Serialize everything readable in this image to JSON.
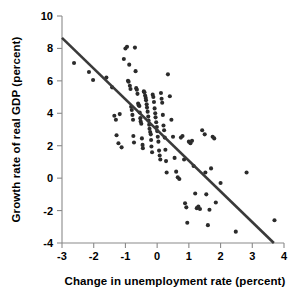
{
  "chart_data": {
    "type": "scatter",
    "title": "",
    "xlabel": "Change in unemployment rate (percent)",
    "ylabel": "Growth rate of real GDP (percent)",
    "xlim": [
      -3,
      4
    ],
    "ylim": [
      -4,
      10
    ],
    "xticks": [
      -3,
      -2,
      -1,
      0,
      1,
      2,
      3,
      4
    ],
    "yticks": [
      -4,
      -2,
      0,
      2,
      4,
      6,
      8,
      10
    ],
    "xticklabels": [
      "-3",
      "-2",
      "-1",
      "0",
      "1",
      "2",
      "3",
      "4"
    ],
    "yticklabels": [
      "-4",
      "-2",
      "0",
      "2",
      "4",
      "6",
      "8",
      "10"
    ],
    "grid": false,
    "legend": null,
    "point_color": "#2b2b2b",
    "line_color": "#3a3a3a",
    "axis_color": "#8a8a8a",
    "trend_line": {
      "label": "regression line",
      "x_start": -3.0,
      "y_start": 8.65,
      "x_end": 3.68,
      "y_end": -4.0,
      "slope": -1.894,
      "intercept": 2.97
    },
    "points": [
      [
        -2.62,
        7.1
      ],
      [
        -2.15,
        6.55
      ],
      [
        -2.02,
        6.05
      ],
      [
        -1.6,
        6.2
      ],
      [
        -1.42,
        5.6
      ],
      [
        -1.35,
        3.85
      ],
      [
        -1.3,
        3.6
      ],
      [
        -1.28,
        2.65
      ],
      [
        -1.22,
        2.15
      ],
      [
        -1.18,
        3.95
      ],
      [
        -1.12,
        1.9
      ],
      [
        -1.05,
        7.35
      ],
      [
        -1.0,
        8.0
      ],
      [
        -0.95,
        8.1
      ],
      [
        -0.92,
        6.0
      ],
      [
        -0.9,
        5.95
      ],
      [
        -0.88,
        7.0
      ],
      [
        -0.86,
        5.7
      ],
      [
        -0.84,
        5.5
      ],
      [
        -0.82,
        4.4
      ],
      [
        -0.8,
        4.2
      ],
      [
        -0.78,
        3.9
      ],
      [
        -0.76,
        3.6
      ],
      [
        -0.75,
        2.6
      ],
      [
        -0.73,
        2.2
      ],
      [
        -0.7,
        8.05
      ],
      [
        -0.68,
        6.6
      ],
      [
        -0.66,
        5.55
      ],
      [
        -0.64,
        5.45
      ],
      [
        -0.62,
        5.2
      ],
      [
        -0.6,
        4.6
      ],
      [
        -0.58,
        4.5
      ],
      [
        -0.56,
        4.45
      ],
      [
        -0.55,
        4.05
      ],
      [
        -0.53,
        3.7
      ],
      [
        -0.52,
        3.5
      ],
      [
        -0.5,
        3.35
      ],
      [
        -0.48,
        2.45
      ],
      [
        -0.46,
        2.05
      ],
      [
        -0.45,
        1.85
      ],
      [
        -0.42,
        5.35
      ],
      [
        -0.4,
        5.3
      ],
      [
        -0.38,
        5.1
      ],
      [
        -0.36,
        4.95
      ],
      [
        -0.35,
        4.8
      ],
      [
        -0.33,
        4.55
      ],
      [
        -0.32,
        4.35
      ],
      [
        -0.3,
        4.1
      ],
      [
        -0.28,
        3.8
      ],
      [
        -0.27,
        3.55
      ],
      [
        -0.25,
        3.3
      ],
      [
        -0.24,
        3.05
      ],
      [
        -0.22,
        2.85
      ],
      [
        -0.2,
        2.7
      ],
      [
        -0.19,
        2.35
      ],
      [
        -0.18,
        1.95
      ],
      [
        -0.16,
        1.6
      ],
      [
        -0.14,
        5.15
      ],
      [
        -0.12,
        5.0
      ],
      [
        -0.1,
        4.7
      ],
      [
        -0.08,
        4.3
      ],
      [
        -0.06,
        4.0
      ],
      [
        -0.05,
        3.75
      ],
      [
        -0.03,
        3.45
      ],
      [
        -0.01,
        3.15
      ],
      [
        0.0,
        2.9
      ],
      [
        0.02,
        2.55
      ],
      [
        0.04,
        2.25
      ],
      [
        0.06,
        1.7
      ],
      [
        0.08,
        1.4
      ],
      [
        0.1,
        1.15
      ],
      [
        0.12,
        5.25
      ],
      [
        0.14,
        4.9
      ],
      [
        0.16,
        4.65
      ],
      [
        0.18,
        3.9
      ],
      [
        0.2,
        3.25
      ],
      [
        0.22,
        2.95
      ],
      [
        0.24,
        2.5
      ],
      [
        0.26,
        1.75
      ],
      [
        0.28,
        1.05
      ],
      [
        0.3,
        0.35
      ],
      [
        0.34,
        6.4
      ],
      [
        0.4,
        5.05
      ],
      [
        0.45,
        3.6
      ],
      [
        0.5,
        2.55
      ],
      [
        0.55,
        1.25
      ],
      [
        0.6,
        0.4
      ],
      [
        0.65,
        0.05
      ],
      [
        0.7,
        -0.05
      ],
      [
        0.75,
        2.5
      ],
      [
        0.8,
        2.6
      ],
      [
        0.85,
        1.15
      ],
      [
        0.88,
        -1.55
      ],
      [
        0.92,
        -1.8
      ],
      [
        0.95,
        -2.75
      ],
      [
        1.0,
        2.25
      ],
      [
        1.05,
        2.15
      ],
      [
        1.1,
        2.3
      ],
      [
        1.15,
        0.75
      ],
      [
        1.2,
        -0.95
      ],
      [
        1.25,
        -1.85
      ],
      [
        1.3,
        -1.75
      ],
      [
        1.35,
        -1.9
      ],
      [
        1.42,
        2.95
      ],
      [
        1.5,
        2.7
      ],
      [
        1.52,
        0.35
      ],
      [
        1.55,
        -1.0
      ],
      [
        1.6,
        -2.9
      ],
      [
        1.65,
        -1.95
      ],
      [
        1.7,
        0.6
      ],
      [
        1.75,
        2.55
      ],
      [
        1.8,
        2.45
      ],
      [
        1.85,
        -1.5
      ],
      [
        2.0,
        -0.3
      ],
      [
        2.48,
        -3.3
      ],
      [
        2.82,
        0.35
      ],
      [
        3.7,
        -2.6
      ]
    ]
  },
  "axis": {
    "x_title": "Change in unemployment rate (percent)",
    "y_title": "Growth rate of real GDP (percent)"
  }
}
